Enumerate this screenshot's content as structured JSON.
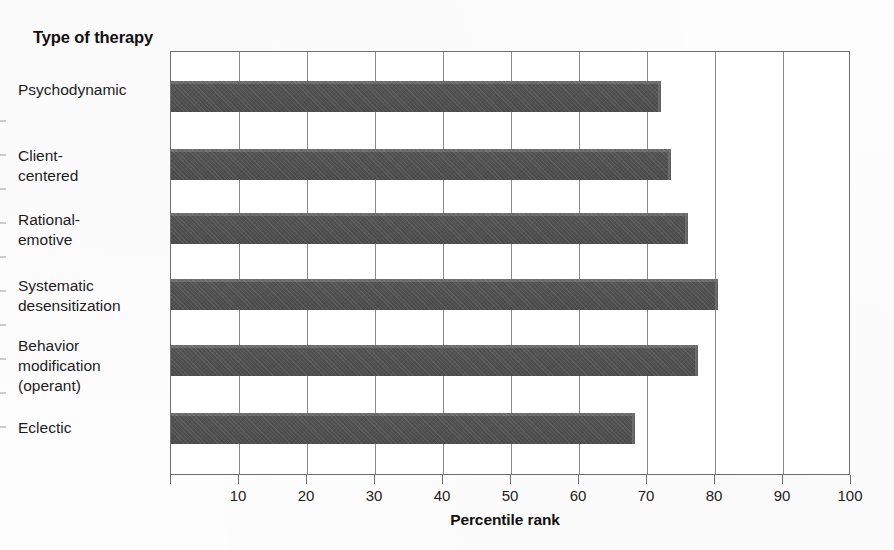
{
  "axis_title": "Type of\ntherapy",
  "x_axis_label": "Percentile rank",
  "categories": [
    "Psychodynamic",
    "Client-\ncentered",
    "Rational-\nemotive",
    "Systematic\ndesensitization",
    "Behavior\nmodification\n(operant)",
    "Eclectic"
  ],
  "tick_labels": [
    "10",
    "20",
    "30",
    "40",
    "50",
    "60",
    "70",
    "80",
    "90",
    "100"
  ],
  "colors": {
    "bar_fill": "#4f4f4f",
    "bar_highlight": "#6d6d6d",
    "frame": "#6e6e6e",
    "gridline": "#8a8a8a",
    "text": "#1d1d1d"
  },
  "chart_data": {
    "type": "bar",
    "orientation": "horizontal",
    "title": "Type of therapy",
    "xlabel": "Percentile rank",
    "ylabel": "Type of therapy",
    "xlim": [
      0,
      100
    ],
    "x_ticks": [
      0,
      10,
      20,
      30,
      40,
      50,
      60,
      70,
      80,
      90,
      100
    ],
    "grid": "vertical gridlines at every 10 units",
    "legend": "none",
    "categories": [
      "Psychodynamic",
      "Client-centered",
      "Rational-emotive",
      "Systematic desensitization",
      "Behavior modification (operant)",
      "Eclectic"
    ],
    "values": [
      72,
      73.5,
      76,
      80.5,
      77.5,
      68.3
    ]
  }
}
